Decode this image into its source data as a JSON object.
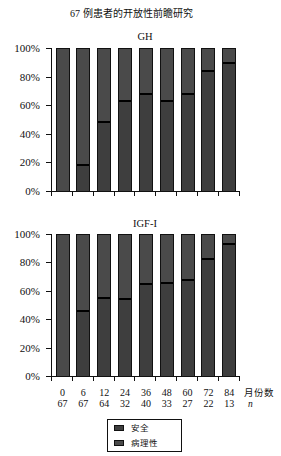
{
  "title": "67 例患者的开放性前瞻研究",
  "x_axis": {
    "label": "月份数",
    "n_label": "n",
    "months": [
      "0",
      "6",
      "12",
      "24",
      "36",
      "48",
      "60",
      "72",
      "84"
    ],
    "n": [
      "67",
      "67",
      "64",
      "32",
      "40",
      "33",
      "27",
      "22",
      "13"
    ]
  },
  "legend": [
    {
      "label": "安全",
      "color": "#3e3e3e"
    },
    {
      "label": "病理性",
      "color": "#4a4a4a"
    }
  ],
  "chart_data": [
    {
      "type": "bar",
      "stacked": true,
      "normalized": true,
      "title": "GH",
      "xlabel": "月份数",
      "ylabel": "",
      "categories": [
        0,
        6,
        12,
        24,
        36,
        48,
        60,
        72,
        84
      ],
      "n": [
        67,
        67,
        64,
        32,
        40,
        33,
        27,
        22,
        13
      ],
      "series": [
        {
          "name": "安全",
          "values": [
            0,
            19,
            49,
            64,
            69,
            64,
            69,
            85,
            91
          ]
        },
        {
          "name": "病理性",
          "values": [
            100,
            81,
            51,
            36,
            31,
            36,
            31,
            15,
            9
          ]
        }
      ],
      "ylim": [
        0,
        100
      ],
      "yticks": [
        0,
        20,
        40,
        60,
        80,
        100
      ],
      "ytick_labels": [
        "0%",
        "20%",
        "40%",
        "60%",
        "80%",
        "100%"
      ],
      "grid": false,
      "legend_position": "bottom"
    },
    {
      "type": "bar",
      "stacked": true,
      "normalized": true,
      "title": "IGF-I",
      "xlabel": "月份数",
      "ylabel": "",
      "categories": [
        0,
        6,
        12,
        24,
        36,
        48,
        60,
        72,
        84
      ],
      "n": [
        67,
        67,
        64,
        32,
        40,
        33,
        27,
        22,
        13
      ],
      "series": [
        {
          "name": "安全",
          "values": [
            0,
            47,
            56,
            55,
            66,
            67,
            69,
            84,
            94
          ]
        },
        {
          "name": "病理性",
          "values": [
            100,
            53,
            44,
            45,
            34,
            33,
            31,
            16,
            6
          ]
        }
      ],
      "ylim": [
        0,
        100
      ],
      "yticks": [
        0,
        20,
        40,
        60,
        80,
        100
      ],
      "ytick_labels": [
        "0%",
        "20%",
        "40%",
        "60%",
        "80%",
        "100%"
      ],
      "grid": false,
      "legend_position": "bottom"
    }
  ]
}
